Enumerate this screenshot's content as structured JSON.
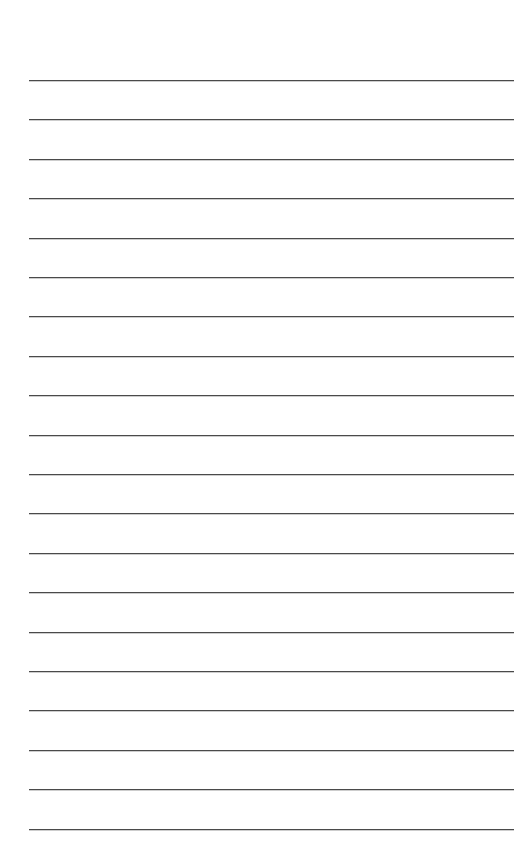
{
  "page": {
    "type": "lined-paper",
    "background_color": "#ffffff",
    "rule_color": "#4a4a4a",
    "rule_count": 20,
    "first_rule_y": 80,
    "rule_spacing": 39.4,
    "rule_left": 29,
    "rule_right": 514
  },
  "lines": [
    {
      "text": ""
    },
    {
      "text": ""
    },
    {
      "text": ""
    },
    {
      "text": ""
    },
    {
      "text": ""
    },
    {
      "text": ""
    },
    {
      "text": ""
    },
    {
      "text": ""
    },
    {
      "text": ""
    },
    {
      "text": ""
    },
    {
      "text": ""
    },
    {
      "text": ""
    },
    {
      "text": ""
    },
    {
      "text": ""
    },
    {
      "text": ""
    },
    {
      "text": ""
    },
    {
      "text": ""
    },
    {
      "text": ""
    },
    {
      "text": ""
    },
    {
      "text": ""
    }
  ]
}
